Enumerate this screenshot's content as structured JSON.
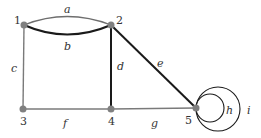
{
  "diagram": {
    "type": "multigraph",
    "colors": {
      "node": "#808080",
      "edge_dark": "#1a1a1a",
      "edge_gray": "#7a7a7a",
      "label": "#333333"
    },
    "nodes": [
      {
        "id": "1",
        "label": "1",
        "x": 24,
        "y": 25
      },
      {
        "id": "2",
        "label": "2",
        "x": 111,
        "y": 25
      },
      {
        "id": "3",
        "label": "3",
        "x": 23,
        "y": 109
      },
      {
        "id": "4",
        "label": "4",
        "x": 111,
        "y": 109
      },
      {
        "id": "5",
        "label": "5",
        "x": 196,
        "y": 108
      }
    ],
    "edges": [
      {
        "id": "a",
        "label": "a",
        "from": "1",
        "to": "2",
        "kind": "arc-up"
      },
      {
        "id": "b",
        "label": "b",
        "from": "1",
        "to": "2",
        "kind": "arc-down"
      },
      {
        "id": "c",
        "label": "c",
        "from": "1",
        "to": "3",
        "kind": "line"
      },
      {
        "id": "d",
        "label": "d",
        "from": "2",
        "to": "4",
        "kind": "line"
      },
      {
        "id": "e",
        "label": "e",
        "from": "2",
        "to": "5",
        "kind": "line"
      },
      {
        "id": "f",
        "label": "f",
        "from": "3",
        "to": "4",
        "kind": "line"
      },
      {
        "id": "g",
        "label": "g",
        "from": "4",
        "to": "5",
        "kind": "line"
      },
      {
        "id": "h",
        "label": "h",
        "from": "5",
        "to": "5",
        "kind": "loop"
      },
      {
        "id": "i",
        "label": "i",
        "from": "5",
        "to": "5",
        "kind": "loop"
      }
    ]
  }
}
